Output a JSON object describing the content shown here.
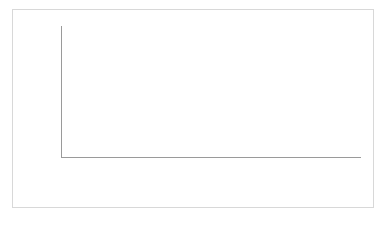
{
  "chart_data": {
    "type": "bar",
    "stacked": true,
    "title": "",
    "subtitle": "",
    "xlabel": "",
    "ylabel": "",
    "categories": [
      "1976",
      "1988",
      "1990",
      "1994",
      "1996",
      "2000",
      "2006",
      "2008",
      "2010"
    ],
    "series": [
      {
        "name": "Other Religion",
        "color": "#6e6e6e",
        "values": [
          6.5,
          7.5,
          8.5,
          10.5,
          11.0,
          9.0,
          9.0,
          8.0,
          9.5
        ]
      },
      {
        "name": "No Religion",
        "color": "#e3e3e3",
        "values": [
          14.0,
          13.0,
          10.5,
          15.0,
          19.0,
          21.0,
          23.0,
          25.0,
          25.5
        ]
      }
    ],
    "totals": [
      20.5,
      20.5,
      19.0,
      25.5,
      30.0,
      30.0,
      32.0,
      33.0,
      35.0
    ],
    "ylim": [
      0,
      50
    ],
    "ytick_values": [
      0,
      10,
      20,
      30,
      40,
      50
    ],
    "ytick_labels": [
      "0%",
      "10%",
      "20%",
      "30%",
      "40%",
      "50%"
    ],
    "grid": true,
    "legend_position": "bottom"
  },
  "legend": {
    "items": [
      {
        "label": "Other Religion",
        "swatch": "dark"
      },
      {
        "label": "No Religion",
        "swatch": "light"
      }
    ]
  }
}
